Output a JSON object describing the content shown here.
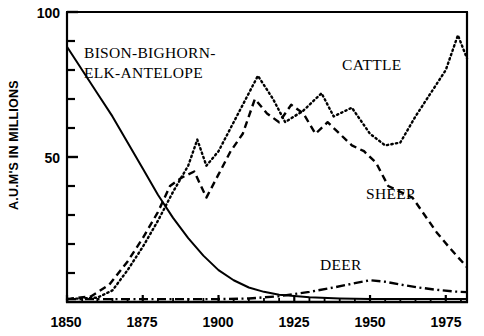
{
  "chart_data": {
    "type": "line",
    "title": "",
    "subtitle": "",
    "xlabel": "",
    "ylabel": "A.U.M'S IN MILLIONS",
    "xlim": [
      1850,
      1982
    ],
    "ylim": [
      0,
      100
    ],
    "grid": false,
    "legend_position": "inline-annotations",
    "x_ticks": [
      1850,
      1875,
      1900,
      1925,
      1950,
      1975
    ],
    "x_tick_labels": [
      "1850",
      "1875",
      "1900",
      "1925",
      "1950",
      "1975"
    ],
    "y_ticks": [
      0,
      10,
      20,
      30,
      40,
      50,
      60,
      70,
      80,
      90,
      100
    ],
    "y_tick_labels": [
      "",
      "",
      "",
      "",
      "",
      "50",
      "",
      "",
      "",
      "",
      "100"
    ],
    "y_major_ticks": [
      50,
      100
    ],
    "series": [
      {
        "name": "BISON-BIGHORN-ELK-ANTELOPE",
        "label": "BISON-BIGHORN-\nELK-ANTELOPE",
        "style": "solid",
        "color": "#000000",
        "x": [
          1850,
          1855,
          1860,
          1865,
          1870,
          1875,
          1880,
          1885,
          1890,
          1895,
          1900,
          1905,
          1910,
          1915,
          1920,
          1930,
          1940,
          1950,
          1960,
          1970,
          1982
        ],
        "values": [
          88,
          80,
          72,
          64,
          55,
          46,
          37,
          29,
          22,
          16,
          11,
          7.5,
          5,
          3.5,
          2.5,
          1.6,
          1.2,
          1,
          1,
          1,
          1
        ]
      },
      {
        "name": "CATTLE",
        "label": "CATTLE",
        "style": "dotted",
        "color": "#000000",
        "x": [
          1850,
          1860,
          1865,
          1870,
          1875,
          1880,
          1885,
          1890,
          1893,
          1896,
          1900,
          1905,
          1910,
          1913,
          1918,
          1922,
          1928,
          1934,
          1938,
          1944,
          1950,
          1955,
          1960,
          1965,
          1970,
          1975,
          1979,
          1982
        ],
        "values": [
          1,
          1.5,
          4,
          11,
          19,
          28,
          38,
          47,
          56,
          47,
          52,
          62,
          72,
          78,
          70,
          62,
          66,
          72,
          64,
          67,
          58,
          54,
          55,
          64,
          72,
          80,
          92,
          84
        ]
      },
      {
        "name": "SHEEP",
        "label": "SHEEP",
        "style": "dashed",
        "color": "#000000",
        "x": [
          1850,
          1858,
          1864,
          1870,
          1875,
          1880,
          1884,
          1888,
          1892,
          1896,
          1900,
          1904,
          1908,
          1912,
          1916,
          1920,
          1924,
          1928,
          1932,
          1936,
          1940,
          1944,
          1948,
          1952,
          1956,
          1960,
          1964,
          1968,
          1972,
          1976,
          1982
        ],
        "values": [
          1,
          2,
          6,
          14,
          22,
          31,
          40,
          43,
          45,
          36,
          44,
          52,
          58,
          70,
          65,
          62,
          68,
          65,
          58,
          62,
          58,
          54,
          52,
          48,
          40,
          38,
          36,
          30,
          24,
          19,
          12
        ]
      },
      {
        "name": "DEER",
        "label": "DEER",
        "style": "dashdot",
        "color": "#000000",
        "x": [
          1850,
          1870,
          1890,
          1900,
          1910,
          1920,
          1930,
          1938,
          1945,
          1950,
          1955,
          1960,
          1966,
          1972,
          1978,
          1982
        ],
        "values": [
          1,
          1,
          1,
          1,
          1.2,
          2,
          3.5,
          5,
          6.5,
          7.5,
          7,
          6,
          5,
          4.2,
          3.6,
          3.4
        ]
      }
    ],
    "annotations": [
      {
        "id": "bison-label-line1",
        "text": "BISON-BIGHORN-",
        "x_px": 84,
        "y_px": 58
      },
      {
        "id": "bison-label-line2",
        "text": "ELK-ANTELOPE",
        "x_px": 84,
        "y_px": 78
      },
      {
        "id": "cattle-label",
        "text": "CATTLE",
        "x_px": 342,
        "y_px": 70
      },
      {
        "id": "sheep-label",
        "text": "SHEEP",
        "x_px": 366,
        "y_px": 199
      },
      {
        "id": "deer-label",
        "text": "DEER",
        "x_px": 320,
        "y_px": 270
      }
    ]
  },
  "axes": {
    "y_axis_title": "A.U.M'S IN MILLIONS",
    "y_labels": [
      {
        "value": "100",
        "y_px": 12
      },
      {
        "value": "50",
        "y_px": 157
      }
    ],
    "x_labels": [
      {
        "value": "1850",
        "x_px": 66
      },
      {
        "value": "1875",
        "x_px": 142
      },
      {
        "value": "1900",
        "x_px": 218
      },
      {
        "value": "1925",
        "x_px": 294
      },
      {
        "value": "1950",
        "x_px": 370
      },
      {
        "value": "1975",
        "x_px": 446
      }
    ]
  }
}
